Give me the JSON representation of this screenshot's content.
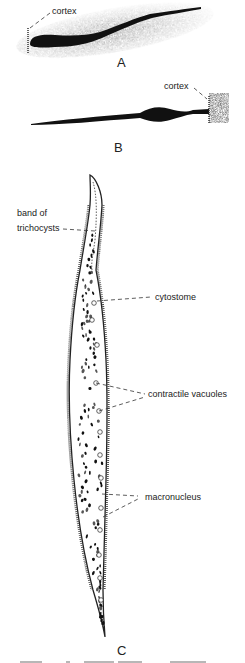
{
  "figure": {
    "panels": [
      {
        "id": "A",
        "label": "A",
        "annotations": [
          {
            "text": "cortex"
          }
        ]
      },
      {
        "id": "B",
        "label": "B",
        "annotations": [
          {
            "text": "cortex"
          }
        ]
      },
      {
        "id": "C",
        "label": "C",
        "annotations": [
          {
            "text": "band of"
          },
          {
            "text": "trichocysts"
          },
          {
            "text": "cytostome"
          },
          {
            "text": "contractile vacuoles"
          },
          {
            "text": "macronucleus"
          }
        ]
      }
    ]
  }
}
